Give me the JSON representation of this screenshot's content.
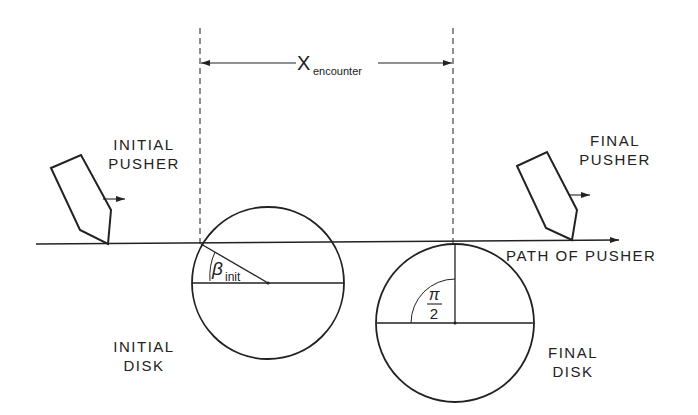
{
  "labels": {
    "x_encounter_main": "X",
    "x_encounter_sub": "encounter",
    "initial_pusher_line1": "INITIAL",
    "initial_pusher_line2": "PUSHER",
    "final_pusher_line1": "FINAL",
    "final_pusher_line2": "PUSHER",
    "path_of_pusher": "PATH OF PUSHER",
    "initial_disk_line1": "INITIAL",
    "initial_disk_line2": "DISK",
    "final_disk_line1": "FINAL",
    "final_disk_line2": "DISK",
    "beta_symbol": "β",
    "beta_sub": "init",
    "pi_numerator": "π",
    "pi_denominator": "2"
  },
  "colors": {
    "ink": "#222222",
    "background": "#ffffff"
  },
  "geometry": {
    "path_y": 243,
    "initial_disk": {
      "cx": 268,
      "cy": 283,
      "r": 77
    },
    "final_disk": {
      "cx": 455,
      "cy": 323,
      "r": 79
    },
    "dashed_left_x": 200,
    "dashed_right_x": 453
  }
}
